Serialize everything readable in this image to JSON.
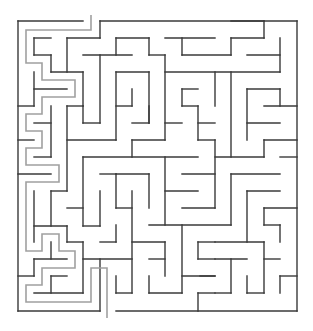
{
  "maze": {
    "title": "Maze",
    "grid": {
      "cols": 17,
      "rows": 17
    },
    "bounds": {
      "left": 18,
      "top": 21,
      "right": 297,
      "bottom": 311
    },
    "entrance": {
      "side": "top",
      "x1": 83,
      "x2": 100
    },
    "exit": {
      "side": "bottom",
      "x1": 100,
      "x2": 116
    },
    "colors": {
      "wall": "#3a3a3a",
      "solution_path": "#a0a0a0",
      "background": "#ffffff"
    },
    "walls": [
      [
        18,
        21,
        83,
        21
      ],
      [
        100,
        21,
        297,
        21
      ],
      [
        18,
        21,
        18,
        311
      ],
      [
        297,
        21,
        297,
        311
      ],
      [
        18,
        311,
        100,
        311
      ],
      [
        116,
        311,
        297,
        311
      ],
      [
        100,
        21,
        100,
        38
      ],
      [
        67,
        38,
        100,
        38
      ],
      [
        67,
        38,
        67,
        72
      ],
      [
        116,
        38,
        116,
        55
      ],
      [
        34,
        38,
        51,
        38
      ],
      [
        34,
        38,
        34,
        55
      ],
      [
        34,
        55,
        51,
        55
      ],
      [
        51,
        55,
        51,
        72
      ],
      [
        51,
        72,
        83,
        72
      ],
      [
        83,
        72,
        83,
        106
      ],
      [
        83,
        55,
        132,
        55
      ],
      [
        100,
        55,
        100,
        123
      ],
      [
        116,
        72,
        116,
        140
      ],
      [
        34,
        72,
        34,
        106
      ],
      [
        34,
        89,
        67,
        89
      ],
      [
        18,
        106,
        34,
        106
      ],
      [
        67,
        106,
        83,
        106
      ],
      [
        51,
        106,
        51,
        157
      ],
      [
        67,
        106,
        67,
        191
      ],
      [
        116,
        38,
        149,
        38
      ],
      [
        165,
        38,
        215,
        38
      ],
      [
        149,
        38,
        149,
        55
      ],
      [
        149,
        55,
        165,
        55
      ],
      [
        165,
        55,
        165,
        140
      ],
      [
        182,
        38,
        182,
        55
      ],
      [
        182,
        55,
        231,
        55
      ],
      [
        116,
        72,
        149,
        72
      ],
      [
        149,
        72,
        149,
        123
      ],
      [
        165,
        72,
        280,
        72
      ],
      [
        116,
        106,
        132,
        106
      ],
      [
        132,
        89,
        132,
        106
      ],
      [
        182,
        89,
        182,
        106
      ],
      [
        182,
        89,
        198,
        89
      ],
      [
        182,
        106,
        198,
        106
      ],
      [
        198,
        106,
        198,
        140
      ],
      [
        231,
        21,
        264,
        21
      ],
      [
        264,
        21,
        264,
        38
      ],
      [
        231,
        38,
        264,
        38
      ],
      [
        231,
        38,
        231,
        55
      ],
      [
        247,
        55,
        280,
        55
      ],
      [
        280,
        38,
        280,
        72
      ],
      [
        215,
        72,
        215,
        106
      ],
      [
        231,
        72,
        231,
        157
      ],
      [
        247,
        89,
        280,
        89
      ],
      [
        247,
        89,
        247,
        140
      ],
      [
        280,
        89,
        280,
        106
      ],
      [
        264,
        106,
        297,
        106
      ],
      [
        34,
        123,
        51,
        123
      ],
      [
        83,
        106,
        83,
        123
      ],
      [
        83,
        123,
        100,
        123
      ],
      [
        67,
        140,
        116,
        140
      ],
      [
        18,
        140,
        34,
        140
      ],
      [
        34,
        157,
        51,
        157
      ],
      [
        83,
        157,
        198,
        157
      ],
      [
        83,
        157,
        83,
        226
      ],
      [
        18,
        174,
        51,
        174
      ],
      [
        100,
        174,
        116,
        174
      ],
      [
        116,
        174,
        116,
        208
      ],
      [
        51,
        191,
        67,
        191
      ],
      [
        51,
        191,
        51,
        226
      ],
      [
        34,
        191,
        34,
        242
      ],
      [
        100,
        191,
        100,
        226
      ],
      [
        67,
        208,
        83,
        208
      ],
      [
        132,
        123,
        149,
        123
      ],
      [
        149,
        106,
        149,
        123
      ],
      [
        165,
        123,
        182,
        123
      ],
      [
        198,
        123,
        215,
        123
      ],
      [
        132,
        140,
        165,
        140
      ],
      [
        198,
        140,
        215,
        140
      ],
      [
        132,
        140,
        132,
        157
      ],
      [
        165,
        157,
        165,
        225
      ],
      [
        116,
        174,
        149,
        174
      ],
      [
        149,
        174,
        149,
        208
      ],
      [
        116,
        208,
        132,
        208
      ],
      [
        132,
        191,
        132,
        293
      ],
      [
        182,
        174,
        215,
        174
      ],
      [
        165,
        191,
        198,
        191
      ],
      [
        182,
        208,
        215,
        208
      ],
      [
        247,
        123,
        280,
        123
      ],
      [
        264,
        140,
        297,
        140
      ],
      [
        264,
        140,
        264,
        157
      ],
      [
        215,
        140,
        215,
        208
      ],
      [
        215,
        157,
        264,
        157
      ],
      [
        280,
        157,
        297,
        157
      ],
      [
        231,
        174,
        280,
        174
      ],
      [
        231,
        174,
        231,
        225
      ],
      [
        247,
        191,
        280,
        191
      ],
      [
        247,
        191,
        247,
        242
      ],
      [
        264,
        208,
        297,
        208
      ],
      [
        264,
        208,
        264,
        225
      ],
      [
        34,
        226,
        67,
        226
      ],
      [
        67,
        226,
        67,
        242
      ],
      [
        67,
        242,
        83,
        242
      ],
      [
        83,
        242,
        83,
        293
      ],
      [
        83,
        226,
        100,
        226
      ],
      [
        51,
        242,
        51,
        259
      ],
      [
        34,
        259,
        67,
        259
      ],
      [
        34,
        259,
        34,
        276
      ],
      [
        18,
        276,
        34,
        276
      ],
      [
        83,
        259,
        132,
        259
      ],
      [
        51,
        276,
        67,
        276
      ],
      [
        51,
        276,
        51,
        293
      ],
      [
        34,
        293,
        83,
        293
      ],
      [
        100,
        259,
        100,
        311
      ],
      [
        149,
        225,
        231,
        225
      ],
      [
        182,
        225,
        182,
        293
      ],
      [
        116,
        225,
        116,
        242
      ],
      [
        100,
        242,
        116,
        242
      ],
      [
        132,
        242,
        165,
        242
      ],
      [
        165,
        242,
        165,
        276
      ],
      [
        149,
        259,
        165,
        259
      ],
      [
        116,
        276,
        116,
        293
      ],
      [
        116,
        293,
        132,
        293
      ],
      [
        149,
        276,
        149,
        293
      ],
      [
        149,
        293,
        182,
        293
      ],
      [
        182,
        276,
        215,
        276
      ],
      [
        198,
        242,
        215,
        242
      ],
      [
        198,
        242,
        198,
        259
      ],
      [
        198,
        259,
        215,
        259
      ],
      [
        198,
        293,
        215,
        293
      ],
      [
        198,
        293,
        198,
        311
      ],
      [
        264,
        225,
        280,
        225
      ],
      [
        280,
        225,
        280,
        242
      ],
      [
        215,
        242,
        264,
        242
      ],
      [
        264,
        242,
        264,
        293
      ],
      [
        215,
        259,
        247,
        259
      ],
      [
        264,
        259,
        280,
        259
      ],
      [
        231,
        259,
        231,
        293
      ],
      [
        215,
        293,
        231,
        293
      ],
      [
        247,
        276,
        247,
        293
      ],
      [
        247,
        293,
        264,
        293
      ],
      [
        200,
        276,
        215,
        276
      ],
      [
        280,
        276,
        297,
        276
      ],
      [
        280,
        276,
        280,
        293
      ]
    ],
    "solution_path": [
      [
        91,
        15
      ],
      [
        91,
        30
      ],
      [
        26,
        30
      ],
      [
        26,
        63
      ],
      [
        42,
        63
      ],
      [
        42,
        80
      ],
      [
        75,
        80
      ],
      [
        75,
        97
      ],
      [
        42,
        97
      ],
      [
        42,
        114
      ],
      [
        26,
        114
      ],
      [
        26,
        131
      ],
      [
        42,
        131
      ],
      [
        42,
        148
      ],
      [
        26,
        148
      ],
      [
        26,
        165
      ],
      [
        59,
        165
      ],
      [
        59,
        182
      ],
      [
        26,
        182
      ],
      [
        26,
        251
      ],
      [
        42,
        251
      ],
      [
        42,
        234
      ],
      [
        59,
        234
      ],
      [
        59,
        251
      ],
      [
        75,
        251
      ],
      [
        75,
        268
      ],
      [
        42,
        268
      ],
      [
        42,
        285
      ],
      [
        26,
        285
      ],
      [
        26,
        302
      ],
      [
        91,
        302
      ],
      [
        91,
        268
      ],
      [
        107,
        268
      ],
      [
        107,
        318
      ]
    ]
  }
}
